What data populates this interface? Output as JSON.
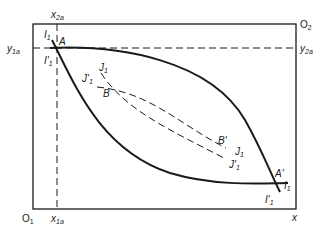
{
  "diagram": {
    "type": "edgeworth-box",
    "colors": {
      "line": "#1a1a1a",
      "background": "#ffffff"
    },
    "origins": {
      "bottom_left": {
        "label": "O",
        "sub": "1"
      },
      "top_right": {
        "label": "O",
        "sub": "2"
      }
    },
    "axis_labels": {
      "x_bottom": "x",
      "x1a": {
        "label": "x",
        "sub": "1a"
      },
      "x2a": {
        "label": "x",
        "sub": "2a"
      },
      "y1a": {
        "label": "y",
        "sub": "1a"
      },
      "y2a": {
        "label": "y",
        "sub": "2a"
      }
    },
    "points": {
      "A": "A",
      "A_prime": "A'",
      "B": "B",
      "B_prime": "B'"
    },
    "curves": {
      "I1": {
        "label": "I",
        "sub": "1"
      },
      "I1_prime": {
        "label": "I'",
        "sub": "1"
      },
      "J1": {
        "label": "J",
        "sub": "1"
      },
      "J1_prime": {
        "label": "J'",
        "sub": "1"
      }
    }
  }
}
